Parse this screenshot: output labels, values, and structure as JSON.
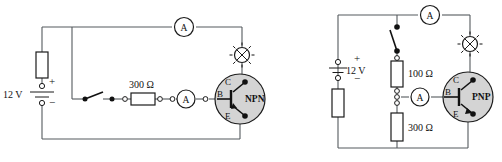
{
  "figure": {
    "background_color": "#ffffff",
    "wire_color": "#555a5e",
    "transistor_fill": "#d4d4d4"
  },
  "circuits": [
    {
      "id": "npn-circuit",
      "name": "NPN common-emitter circuit",
      "battery": {
        "label": "12 V",
        "plus": "+",
        "minus": "−"
      },
      "components": {
        "collector_resistor": {
          "name": "collector-resistor",
          "label": ""
        },
        "base_resistor": {
          "name": "base-resistor",
          "label": "300 Ω"
        },
        "switch": {
          "name": "base-switch",
          "label": "",
          "state": "open"
        },
        "lamp": {
          "name": "lamp",
          "label": ""
        }
      },
      "meters": [
        {
          "name": "collector-ammeter",
          "label": "A",
          "position": "top"
        },
        {
          "name": "base-ammeter",
          "label": "A",
          "position": "base-branch"
        }
      ],
      "transistor": {
        "type": "NPN",
        "pins": {
          "collector": "C",
          "base": "B",
          "emitter": "E"
        }
      }
    },
    {
      "id": "pnp-circuit",
      "name": "PNP common-emitter circuit",
      "battery": {
        "label": "12 V",
        "plus": "+",
        "minus": "−"
      },
      "components": {
        "series_resistor": {
          "name": "series-resistor",
          "label": ""
        },
        "upper_divider_resistor": {
          "name": "upper-divider-resistor",
          "label": "100 Ω"
        },
        "lower_divider_resistor": {
          "name": "lower-divider-resistor",
          "label": "300 Ω"
        },
        "switch": {
          "name": "supply-switch",
          "label": "",
          "state": "open"
        },
        "lamp": {
          "name": "lamp",
          "label": ""
        }
      },
      "meters": [
        {
          "name": "collector-ammeter",
          "label": "A",
          "position": "top"
        },
        {
          "name": "base-ammeter",
          "label": "A",
          "position": "base-branch"
        }
      ],
      "transistor": {
        "type": "PNP",
        "pins": {
          "collector": "C",
          "base": "B",
          "emitter": "E"
        }
      }
    }
  ]
}
